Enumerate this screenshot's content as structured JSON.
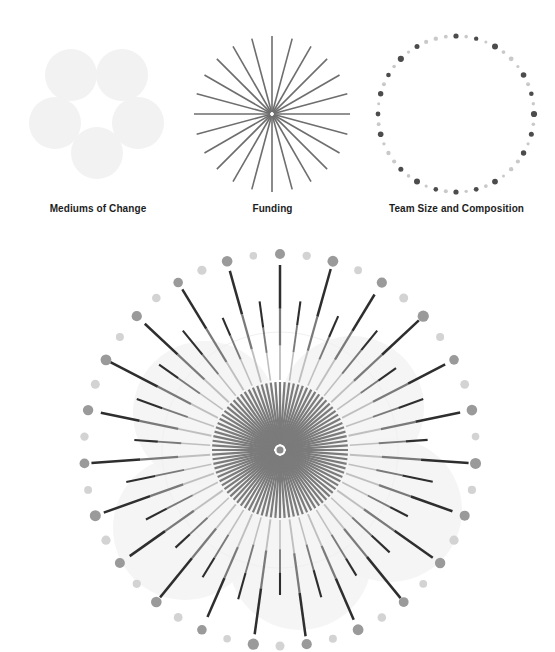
{
  "canvas": {
    "width": 555,
    "height": 652,
    "background": "#ffffff"
  },
  "palette": {
    "label_text": "#1d1d1d",
    "blob_fill": "#f2f2f2",
    "blob_fill_faint": "#f4f4f4",
    "ray_stroke": "#6e6e6e",
    "dot_dark": "#4c4c4c",
    "dot_light": "#c9c9c9",
    "line_dark": "#2e2e2e",
    "line_mid": "#7a7a7a",
    "line_light": "#bfbfbf",
    "inner_fan": "#7b7b7b"
  },
  "legend": {
    "items": [
      {
        "id": "mediums-of-change",
        "label": "Mediums of Change",
        "glyph": "five-circles",
        "circle_count": 5,
        "circle_radius": 26,
        "circle_color": "#f2f2f2",
        "circles": [
          {
            "cx": 71,
            "cy": 57
          },
          {
            "cx": 122,
            "cy": 57
          },
          {
            "cx": 55,
            "cy": 105
          },
          {
            "cx": 138,
            "cy": 105
          },
          {
            "cx": 97,
            "cy": 135
          }
        ]
      },
      {
        "id": "funding",
        "label": "Funding",
        "glyph": "starburst",
        "ray_count": 24,
        "ray_color": "#6e6e6e",
        "ray_length": 78,
        "ray_width": 1.6,
        "center": {
          "cx": 87,
          "cy": 96
        }
      },
      {
        "id": "team-size-and-composition",
        "label": "Team Size and Composition",
        "glyph": "dotted-ring",
        "dot_count": 48,
        "ring_radius": 78,
        "center": {
          "cx": 98,
          "cy": 96
        },
        "dot_dark": "#4c4c4c",
        "dot_light": "#c9c9c9",
        "dot_radii": [
          2.6,
          1.8,
          2.2,
          1.5,
          3.0,
          1.9,
          2.4,
          1.6,
          2.8,
          2.0,
          2.3,
          1.7,
          3.1,
          1.8,
          2.5,
          1.6,
          2.7,
          2.1,
          2.2,
          1.5,
          2.9,
          1.9,
          2.4,
          1.7,
          2.6,
          2.0,
          2.3,
          1.6,
          3.0,
          1.8,
          2.5,
          2.1,
          2.2,
          1.7,
          2.8,
          1.9,
          2.4,
          1.5,
          2.7,
          2.0,
          2.3,
          1.8,
          3.1,
          1.6,
          2.5,
          2.1,
          2.2,
          1.9
        ],
        "dot_shades": [
          "dark",
          "light",
          "dark",
          "light",
          "dark",
          "light",
          "light",
          "light",
          "dark",
          "light",
          "dark",
          "light",
          "dark",
          "light",
          "dark",
          "light",
          "dark",
          "light",
          "light",
          "light",
          "dark",
          "light",
          "dark",
          "light",
          "dark",
          "light",
          "dark",
          "light",
          "dark",
          "light",
          "dark",
          "light",
          "light",
          "light",
          "dark",
          "light",
          "dark",
          "light",
          "dark",
          "light",
          "dark",
          "light",
          "dark",
          "light",
          "dark",
          "light",
          "light",
          "light"
        ]
      }
    ]
  },
  "chart_data": {
    "type": "radial-sunburst",
    "title": "",
    "center": {
      "cx": 280,
      "cy": 222
    },
    "spoke_count": 46,
    "inner_fan": {
      "description": "dense inner radial fan",
      "ray_count": 92,
      "inner_radius": 6,
      "outer_radius": 68,
      "color": "#7b7b7b",
      "width": 2.2
    },
    "background_blobs": {
      "color": "#f3f3f3",
      "radius": 72,
      "centers": [
        {
          "cx": 205,
          "cy": 185
        },
        {
          "cx": 352,
          "cy": 180
        },
        {
          "cx": 185,
          "cy": 300
        },
        {
          "cx": 300,
          "cy": 330
        },
        {
          "cx": 390,
          "cy": 282
        }
      ]
    },
    "outline_circle": {
      "radius": 118,
      "color": "#f0f0f0"
    },
    "dot_ring": {
      "radius": 196,
      "dot_dark": "#9a9a9a",
      "dot_light": "#d3d3d3",
      "radii": [
        5.0,
        4.2,
        5.4,
        3.9,
        5.1,
        4.5,
        5.6,
        4.0,
        4.8,
        4.4,
        5.3,
        3.8,
        5.5,
        4.1,
        5.0,
        4.6,
        5.2,
        3.9,
        4.9,
        4.3,
        5.4,
        4.0,
        5.1,
        4.5,
        5.6,
        3.8,
        4.8,
        4.4,
        5.3,
        4.1,
        5.0,
        4.6,
        5.5,
        3.9,
        4.9,
        4.2,
        5.2,
        4.5,
        5.4,
        4.0,
        5.1,
        4.3,
        4.8,
        4.6,
        5.3,
        3.8
      ],
      "shades": [
        "dark",
        "light",
        "dark",
        "light",
        "dark",
        "light",
        "dark",
        "light",
        "dark",
        "light",
        "dark",
        "light",
        "dark",
        "light",
        "dark",
        "light",
        "dark",
        "light",
        "dark",
        "light",
        "dark",
        "light",
        "dark",
        "light",
        "dark",
        "light",
        "dark",
        "light",
        "dark",
        "light",
        "dark",
        "light",
        "dark",
        "light",
        "dark",
        "light",
        "dark",
        "light",
        "dark",
        "light",
        "dark",
        "light",
        "dark",
        "light",
        "dark",
        "light"
      ]
    },
    "spokes": [
      {
        "type": "long",
        "inner": 70,
        "outer": 185,
        "seg_light": 0.3,
        "seg_mid": 0.32
      },
      {
        "type": "short",
        "inner": 70,
        "outer": 150,
        "seg_light": 0.36,
        "seg_mid": 0.34
      },
      {
        "type": "long",
        "inner": 70,
        "outer": 188,
        "seg_light": 0.28,
        "seg_mid": 0.3
      },
      {
        "type": "short",
        "inner": 70,
        "outer": 146,
        "seg_light": 0.38,
        "seg_mid": 0.32
      },
      {
        "type": "long",
        "inner": 70,
        "outer": 182,
        "seg_light": 0.32,
        "seg_mid": 0.3
      },
      {
        "type": "short",
        "inner": 70,
        "outer": 154,
        "seg_light": 0.34,
        "seg_mid": 0.36
      },
      {
        "type": "long",
        "inner": 70,
        "outer": 190,
        "seg_light": 0.26,
        "seg_mid": 0.32
      },
      {
        "type": "short",
        "inner": 70,
        "outer": 142,
        "seg_light": 0.4,
        "seg_mid": 0.3
      },
      {
        "type": "long",
        "inner": 70,
        "outer": 186,
        "seg_light": 0.3,
        "seg_mid": 0.34
      },
      {
        "type": "short",
        "inner": 70,
        "outer": 152,
        "seg_light": 0.35,
        "seg_mid": 0.33
      },
      {
        "type": "long",
        "inner": 70,
        "outer": 184,
        "seg_light": 0.29,
        "seg_mid": 0.31
      },
      {
        "type": "short",
        "inner": 70,
        "outer": 148,
        "seg_light": 0.37,
        "seg_mid": 0.35
      },
      {
        "type": "long",
        "inner": 70,
        "outer": 189,
        "seg_light": 0.27,
        "seg_mid": 0.33
      },
      {
        "type": "short",
        "inner": 70,
        "outer": 156,
        "seg_light": 0.33,
        "seg_mid": 0.31
      },
      {
        "type": "long",
        "inner": 70,
        "outer": 183,
        "seg_light": 0.31,
        "seg_mid": 0.3
      },
      {
        "type": "short",
        "inner": 70,
        "outer": 144,
        "seg_light": 0.39,
        "seg_mid": 0.34
      },
      {
        "type": "long",
        "inner": 70,
        "outer": 187,
        "seg_light": 0.28,
        "seg_mid": 0.32
      },
      {
        "type": "short",
        "inner": 70,
        "outer": 150,
        "seg_light": 0.36,
        "seg_mid": 0.33
      },
      {
        "type": "long",
        "inner": 70,
        "outer": 191,
        "seg_light": 0.26,
        "seg_mid": 0.3
      },
      {
        "type": "short",
        "inner": 70,
        "outer": 147,
        "seg_light": 0.38,
        "seg_mid": 0.36
      },
      {
        "type": "long",
        "inner": 70,
        "outer": 185,
        "seg_light": 0.3,
        "seg_mid": 0.31
      },
      {
        "type": "short",
        "inner": 70,
        "outer": 153,
        "seg_light": 0.34,
        "seg_mid": 0.32
      },
      {
        "type": "long",
        "inner": 70,
        "outer": 188,
        "seg_light": 0.29,
        "seg_mid": 0.34
      },
      {
        "type": "short",
        "inner": 70,
        "outer": 145,
        "seg_light": 0.39,
        "seg_mid": 0.31
      },
      {
        "type": "long",
        "inner": 70,
        "outer": 186,
        "seg_light": 0.27,
        "seg_mid": 0.33
      },
      {
        "type": "short",
        "inner": 70,
        "outer": 155,
        "seg_light": 0.33,
        "seg_mid": 0.35
      },
      {
        "type": "long",
        "inner": 70,
        "outer": 182,
        "seg_light": 0.32,
        "seg_mid": 0.3
      },
      {
        "type": "short",
        "inner": 70,
        "outer": 149,
        "seg_light": 0.37,
        "seg_mid": 0.34
      },
      {
        "type": "long",
        "inner": 70,
        "outer": 190,
        "seg_light": 0.26,
        "seg_mid": 0.32
      },
      {
        "type": "short",
        "inner": 70,
        "outer": 143,
        "seg_light": 0.4,
        "seg_mid": 0.33
      },
      {
        "type": "long",
        "inner": 70,
        "outer": 184,
        "seg_light": 0.31,
        "seg_mid": 0.31
      },
      {
        "type": "short",
        "inner": 70,
        "outer": 151,
        "seg_light": 0.35,
        "seg_mid": 0.36
      },
      {
        "type": "long",
        "inner": 70,
        "outer": 187,
        "seg_light": 0.28,
        "seg_mid": 0.3
      },
      {
        "type": "short",
        "inner": 70,
        "outer": 157,
        "seg_light": 0.32,
        "seg_mid": 0.34
      },
      {
        "type": "long",
        "inner": 70,
        "outer": 189,
        "seg_light": 0.27,
        "seg_mid": 0.32
      },
      {
        "type": "short",
        "inner": 70,
        "outer": 146,
        "seg_light": 0.38,
        "seg_mid": 0.31
      },
      {
        "type": "long",
        "inner": 70,
        "outer": 183,
        "seg_light": 0.3,
        "seg_mid": 0.35
      },
      {
        "type": "short",
        "inner": 70,
        "outer": 152,
        "seg_light": 0.34,
        "seg_mid": 0.33
      },
      {
        "type": "long",
        "inner": 70,
        "outer": 191,
        "seg_light": 0.25,
        "seg_mid": 0.31
      },
      {
        "type": "short",
        "inner": 70,
        "outer": 148,
        "seg_light": 0.36,
        "seg_mid": 0.34
      },
      {
        "type": "long",
        "inner": 70,
        "outer": 185,
        "seg_light": 0.29,
        "seg_mid": 0.32
      },
      {
        "type": "short",
        "inner": 70,
        "outer": 154,
        "seg_light": 0.33,
        "seg_mid": 0.3
      },
      {
        "type": "long",
        "inner": 70,
        "outer": 188,
        "seg_light": 0.28,
        "seg_mid": 0.33
      },
      {
        "type": "short",
        "inner": 70,
        "outer": 144,
        "seg_light": 0.39,
        "seg_mid": 0.35
      },
      {
        "type": "long",
        "inner": 70,
        "outer": 186,
        "seg_light": 0.3,
        "seg_mid": 0.31
      },
      {
        "type": "short",
        "inner": 70,
        "outer": 150,
        "seg_light": 0.35,
        "seg_mid": 0.32
      }
    ]
  }
}
